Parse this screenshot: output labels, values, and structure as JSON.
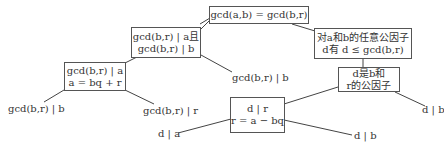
{
  "diagram": {
    "type": "proof-tree",
    "nodes": {
      "root": {
        "lines": [
          "gcd(a,b) = gcd(b,r)"
        ]
      },
      "left1": {
        "lines": [
          "gcd(b,r) | a且",
          "gcd(b,r) | b"
        ]
      },
      "right1": {
        "lines": [
          "对a和b的任意公因子",
          "d有 d ≤ gcd(b,r)"
        ]
      },
      "left2": {
        "lines": [
          "gcd(b,r) | a",
          "a = bq + r"
        ]
      },
      "right2": {
        "lines": [
          "d是b和",
          "r的公因子"
        ]
      },
      "mid3": {
        "lines": [
          "d | r",
          "r = a − bq"
        ]
      }
    },
    "leaves": {
      "left_b": "gcd(b,r) | b",
      "left_r": "gcd(b,r) | r",
      "mid_b": "gcd(b,r) | b",
      "d_a": "d | a",
      "d_b_low": "d | b",
      "d_b_right": "d | b"
    },
    "edges": [
      [
        "root",
        "left1"
      ],
      [
        "root",
        "right1"
      ],
      [
        "left1",
        "left2"
      ],
      [
        "left1",
        "mid_b"
      ],
      [
        "left2",
        "left_b"
      ],
      [
        "left2",
        "left_r"
      ],
      [
        "right1",
        "right2"
      ],
      [
        "right2",
        "mid3"
      ],
      [
        "right2",
        "d_b_right"
      ],
      [
        "mid3",
        "d_a"
      ],
      [
        "mid3",
        "d_b_low"
      ]
    ],
    "colors": {
      "border": "#555555",
      "text": "#333333",
      "edge": "#444444",
      "background": "#ffffff"
    }
  }
}
